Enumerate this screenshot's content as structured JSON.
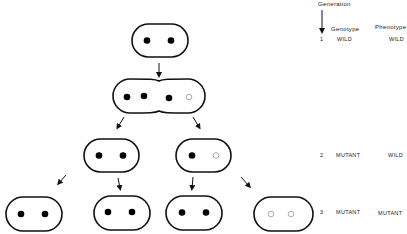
{
  "legend": {
    "generation_header": "Generation",
    "genotype_header": "Genotype",
    "phenotype_header": "Phenotype",
    "rows": [
      {
        "generation": "1",
        "genotype": "WILD",
        "phenotype": "WILD"
      },
      {
        "generation": "2",
        "genotype": "MUTANT",
        "phenotype": "WILD"
      },
      {
        "generation": "3",
        "genotype": "MUTANT",
        "phenotype": "MUTANT"
      }
    ]
  },
  "cells": [
    {
      "id": "gen1-parent",
      "generation": 1,
      "nucleoids": [
        "wild",
        "wild"
      ]
    },
    {
      "id": "gen1-dividing",
      "generation": 1,
      "nucleoids": [
        "wild",
        "wild",
        "wild",
        "mutant"
      ],
      "dividing": true
    },
    {
      "id": "gen2-left",
      "generation": 2,
      "nucleoids": [
        "wild",
        "wild"
      ]
    },
    {
      "id": "gen2-right",
      "generation": 2,
      "nucleoids": [
        "wild",
        "mutant"
      ]
    },
    {
      "id": "gen3-1",
      "generation": 3,
      "nucleoids": [
        "wild",
        "wild"
      ]
    },
    {
      "id": "gen3-2",
      "generation": 3,
      "nucleoids": [
        "wild",
        "wild"
      ]
    },
    {
      "id": "gen3-3",
      "generation": 3,
      "nucleoids": [
        "wild",
        "wild"
      ]
    },
    {
      "id": "gen3-4",
      "generation": 3,
      "nucleoids": [
        "mutant",
        "mutant"
      ]
    }
  ],
  "colors": {
    "wild": "#000000",
    "mutant": "#ffffff",
    "outline": "#111111"
  }
}
